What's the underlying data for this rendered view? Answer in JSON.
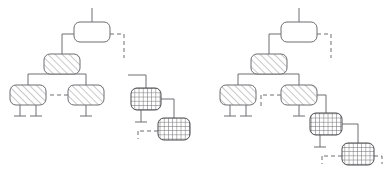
{
  "page": {
    "background_color": "#ffffff",
    "width": 387,
    "height": 179
  },
  "style": {
    "stroke_color": "#6e6e72",
    "stroke_color_dark": "#4a4a4f",
    "hatch_color": "#9a9aa0",
    "crosshatch_color": "#6e6e72",
    "fill_plain": "#ffffff",
    "stroke_width": 1,
    "node_radius": 6,
    "dash_pattern": "4,3"
  },
  "legend": {
    "fill_styles": [
      {
        "key": "plain",
        "label": "plain"
      },
      {
        "key": "hatch",
        "label": "diagonal-hatch"
      },
      {
        "key": "crosshatch",
        "label": "cross-hatch"
      }
    ],
    "edge_styles": [
      {
        "key": "solid",
        "label": "solid"
      },
      {
        "key": "dashed",
        "label": "dashed"
      }
    ]
  },
  "groups": [
    {
      "id": "left-group",
      "name": "left-tree",
      "nodes": [
        {
          "id": "L-root",
          "name": "root",
          "x": 74,
          "y": 22,
          "w": 36,
          "h": 20,
          "fill": "plain"
        },
        {
          "id": "L-mid",
          "name": "level1",
          "x": 44,
          "y": 54,
          "w": 36,
          "h": 20,
          "fill": "hatch"
        },
        {
          "id": "L-leaf1",
          "name": "level2-left",
          "x": 10,
          "y": 85,
          "w": 36,
          "h": 20,
          "fill": "hatch"
        },
        {
          "id": "L-leaf2",
          "name": "level2-right",
          "x": 68,
          "y": 85,
          "w": 36,
          "h": 20,
          "fill": "hatch"
        },
        {
          "id": "L-cx1",
          "name": "aux-upper",
          "x": 131,
          "y": 88,
          "w": 30,
          "h": 22,
          "fill": "crosshatch"
        },
        {
          "id": "L-cx2",
          "name": "aux-lower",
          "x": 158,
          "y": 118,
          "w": 32,
          "h": 22,
          "fill": "crosshatch"
        }
      ],
      "edges": [
        {
          "name": "root-stem",
          "style": "solid",
          "points": "92,8 92,22"
        },
        {
          "name": "root-to-mid",
          "style": "solid",
          "points": "74,34 62,34 62,54"
        },
        {
          "name": "root-dashed-out",
          "style": "dashed",
          "points": "110,34 124,34 124,58"
        },
        {
          "name": "mid-to-leaf1",
          "style": "solid",
          "points": "62,74 28,74 28,85"
        },
        {
          "name": "mid-to-leaf2",
          "style": "solid",
          "points": "62,74 86,74 86,85"
        },
        {
          "name": "leaf2-dashed-in",
          "style": "dashed",
          "points": "68,95 50,95"
        },
        {
          "name": "leaf1-stub-a",
          "style": "solid",
          "points": "20,105 20,116"
        },
        {
          "name": "leaf1-stub-a-bar",
          "style": "solid",
          "points": "14,116 26,116"
        },
        {
          "name": "leaf1-stub-b",
          "style": "solid",
          "points": "36,105 36,116"
        },
        {
          "name": "leaf1-stub-b-bar",
          "style": "solid",
          "points": "30,116 42,116"
        },
        {
          "name": "leaf2-stub",
          "style": "solid",
          "points": "86,105 86,116"
        },
        {
          "name": "leaf2-stub-bar",
          "style": "solid",
          "points": "80,116 92,116"
        },
        {
          "name": "cx1-stem",
          "style": "solid",
          "points": "146,75 146,88"
        },
        {
          "name": "cx1-stem-left",
          "style": "solid",
          "points": "128,75 146,75"
        },
        {
          "name": "cx1-to-cx2",
          "style": "solid",
          "points": "161,99 174,99 174,118"
        },
        {
          "name": "cx1-stub",
          "style": "solid",
          "points": "141,110 141,122"
        },
        {
          "name": "cx1-stub-bar",
          "style": "solid",
          "points": "135,122 147,122"
        },
        {
          "name": "cx2-dashed-in",
          "style": "dashed",
          "points": "158,131 138,131"
        },
        {
          "name": "cx2-dashed-tick",
          "style": "dashed",
          "points": "138,131 138,139"
        }
      ]
    },
    {
      "id": "right-group",
      "name": "right-tree",
      "nodes": [
        {
          "id": "R-root",
          "name": "root",
          "x": 281,
          "y": 22,
          "w": 36,
          "h": 20,
          "fill": "plain"
        },
        {
          "id": "R-mid",
          "name": "level1",
          "x": 251,
          "y": 54,
          "w": 36,
          "h": 20,
          "fill": "hatch"
        },
        {
          "id": "R-leaf1",
          "name": "level2-left",
          "x": 220,
          "y": 85,
          "w": 36,
          "h": 20,
          "fill": "hatch"
        },
        {
          "id": "R-leaf2",
          "name": "level2-right",
          "x": 281,
          "y": 85,
          "w": 36,
          "h": 20,
          "fill": "hatch"
        },
        {
          "id": "R-cx1",
          "name": "aux-upper",
          "x": 310,
          "y": 113,
          "w": 32,
          "h": 22,
          "fill": "crosshatch"
        },
        {
          "id": "R-cx2",
          "name": "aux-lower",
          "x": 342,
          "y": 143,
          "w": 32,
          "h": 22,
          "fill": "crosshatch"
        }
      ],
      "edges": [
        {
          "name": "root-stem",
          "style": "solid",
          "points": "299,8 299,22"
        },
        {
          "name": "root-to-mid",
          "style": "solid",
          "points": "281,34 269,34 269,54"
        },
        {
          "name": "root-dashed-out",
          "style": "dashed",
          "points": "317,34 331,34 331,58"
        },
        {
          "name": "mid-to-leaf1",
          "style": "solid",
          "points": "269,74 238,74 238,85"
        },
        {
          "name": "mid-to-leaf2",
          "style": "solid",
          "points": "269,74 299,74 299,85"
        },
        {
          "name": "leaf2-dashed-in",
          "style": "dashed",
          "points": "281,95 261,95"
        },
        {
          "name": "leaf2-dash-tick",
          "style": "dashed",
          "points": "261,95 261,107"
        },
        {
          "name": "leaf1-stub-a",
          "style": "solid",
          "points": "230,105 230,116"
        },
        {
          "name": "leaf1-stub-a-bar",
          "style": "solid",
          "points": "224,116 236,116"
        },
        {
          "name": "leaf1-stub-b",
          "style": "solid",
          "points": "246,105 246,116"
        },
        {
          "name": "leaf1-stub-b-bar",
          "style": "solid",
          "points": "240,116 252,116"
        },
        {
          "name": "leaf2-stub",
          "style": "solid",
          "points": "299,105 299,116"
        },
        {
          "name": "leaf2-stub-bar",
          "style": "solid",
          "points": "293,116 305,116"
        },
        {
          "name": "leaf2-to-cx1",
          "style": "solid",
          "points": "317,95 326,95 326,113"
        },
        {
          "name": "cx1-to-cx2",
          "style": "solid",
          "points": "342,124 358,124 358,143"
        },
        {
          "name": "cx1-stub",
          "style": "solid",
          "points": "320,135 320,147"
        },
        {
          "name": "cx1-stub-bar",
          "style": "solid",
          "points": "314,147 326,147"
        },
        {
          "name": "cx2-dashed-in",
          "style": "dashed",
          "points": "342,156 322,156"
        },
        {
          "name": "cx2-dashed-tick",
          "style": "dashed",
          "points": "322,156 322,164"
        },
        {
          "name": "cx2-right-tick",
          "style": "dashed",
          "points": "374,156 382,156 382,164"
        }
      ]
    }
  ]
}
